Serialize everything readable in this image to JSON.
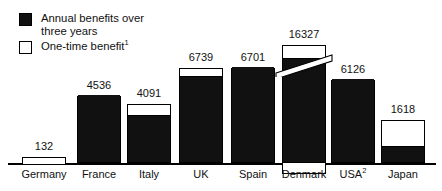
{
  "legend": {
    "items": [
      {
        "swatch": "filled",
        "label": "Annual benefits over\nthree years",
        "icon": "filled-square-icon"
      },
      {
        "swatch": "hollow",
        "label": "One-time benefit",
        "superscript": "1",
        "icon": "hollow-square-icon"
      }
    ]
  },
  "chart_data": {
    "type": "bar",
    "title": "",
    "subtitle": "",
    "xlabel": "",
    "ylabel": "",
    "grid": false,
    "legend_position": "top-left",
    "axis_break": {
      "category": "Denmark",
      "note": "diagonal break mark on bar indicating truncated scale"
    },
    "categories": [
      "Germany",
      "France",
      "Italy",
      "UK",
      "Spain",
      "Denmark",
      "USA",
      "Japan"
    ],
    "category_superscripts": [
      "",
      "",
      "",
      "",
      "",
      "",
      "2",
      ""
    ],
    "values": [
      132,
      4536,
      4091,
      6739,
      6701,
      16327,
      6126,
      1618
    ],
    "value_labels": [
      "132",
      "4536",
      "4091",
      "6739",
      "6701",
      "16327",
      "6126",
      "1618"
    ],
    "series": [
      {
        "name": "Annual benefits over three years",
        "values": [
          0,
          4536,
          3340,
          6180,
          6701,
          16327,
          6126,
          560
        ]
      },
      {
        "name": "One-time benefit",
        "values": [
          132,
          0,
          751,
          559,
          0,
          900,
          0,
          1058
        ]
      }
    ],
    "ylim": [
      0,
      17000
    ],
    "bars": [
      {
        "category": "Germany",
        "label": "132",
        "x": 22,
        "width": 44,
        "top": 157,
        "bottom": 163,
        "onetime_height": 6,
        "has_annual": false,
        "has_onetime": true,
        "onetime_below_baseline": false,
        "break": false,
        "label_y": 140
      },
      {
        "category": "France",
        "label": "4536",
        "x": 77,
        "width": 44,
        "top": 96,
        "bottom": 163,
        "onetime_height": 0,
        "has_annual": true,
        "has_onetime": false,
        "onetime_below_baseline": false,
        "break": false,
        "label_y": 79
      },
      {
        "category": "Italy",
        "label": "4091",
        "x": 127,
        "width": 44,
        "top": 104,
        "bottom": 163,
        "onetime_height": 11,
        "has_annual": true,
        "has_onetime": true,
        "onetime_below_baseline": false,
        "break": false,
        "label_y": 87
      },
      {
        "category": "UK",
        "label": "6739",
        "x": 179,
        "width": 44,
        "top": 68,
        "bottom": 163,
        "onetime_height": 8,
        "has_annual": true,
        "has_onetime": true,
        "onetime_below_baseline": false,
        "break": false,
        "label_y": 51
      },
      {
        "category": "Spain",
        "label": "6701",
        "x": 231,
        "width": 44,
        "top": 68,
        "bottom": 163,
        "onetime_height": 0,
        "has_annual": true,
        "has_onetime": false,
        "onetime_below_baseline": false,
        "break": false,
        "label_y": 51
      },
      {
        "category": "Denmark",
        "label": "16327",
        "x": 282,
        "width": 44,
        "top": 45,
        "bottom": 163,
        "onetime_height": 13,
        "has_annual": true,
        "has_onetime": true,
        "onetime_below_baseline": true,
        "break": true,
        "label_y": 28
      },
      {
        "category": "USA",
        "label": "6126",
        "x": 331,
        "width": 44,
        "top": 80,
        "bottom": 163,
        "onetime_height": 0,
        "has_annual": true,
        "has_onetime": false,
        "onetime_below_baseline": false,
        "break": false,
        "label_y": 63
      },
      {
        "category": "Japan",
        "label": "1618",
        "x": 381,
        "width": 44,
        "top": 120,
        "bottom": 163,
        "onetime_height": 26,
        "has_annual": true,
        "has_onetime": true,
        "onetime_below_baseline": false,
        "break": false,
        "label_y": 103
      }
    ]
  },
  "colors": {
    "annual": "#111111",
    "onetime": "#ffffff",
    "outline": "#000000",
    "text": "#111111",
    "background": "#ffffff"
  }
}
